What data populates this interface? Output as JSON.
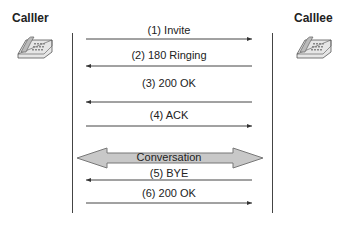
{
  "parties": {
    "caller": {
      "label": "Calller",
      "icon": "telephone-icon"
    },
    "callee": {
      "label": "Calllee",
      "icon": "telephone-icon"
    }
  },
  "messages": [
    {
      "label": "(1) Invite",
      "direction": "caller-to-callee"
    },
    {
      "label": "(2) 180 Ringing",
      "direction": "callee-to-caller"
    },
    {
      "label": "(3) 200 OK",
      "direction": "callee-to-caller"
    },
    {
      "label": "(4) ACK",
      "direction": "caller-to-callee"
    },
    {
      "label": "(5) BYE",
      "direction": "callee-to-caller"
    },
    {
      "label": "(6) 200 OK",
      "direction": "caller-to-callee"
    }
  ],
  "conversation": {
    "label": "Conversation",
    "direction": "bidirectional"
  },
  "colors": {
    "line": "#444444",
    "conversation_fill": "#c8c8c8",
    "conversation_stroke": "#777777"
  }
}
